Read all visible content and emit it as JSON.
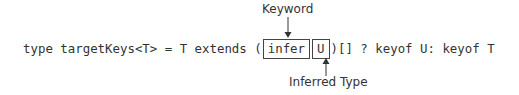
{
  "diagram": {
    "code_before": "type targetKeys<T> = T extends (",
    "keyword_box": "infer",
    "inferred_box": "U",
    "code_after": ")[] ? keyof U: keyof T",
    "top_label": "Keyword",
    "bottom_label": "Inferred Type",
    "colors": {
      "text": "#333333",
      "box_border": "#444444",
      "background": "#ffffff"
    }
  }
}
